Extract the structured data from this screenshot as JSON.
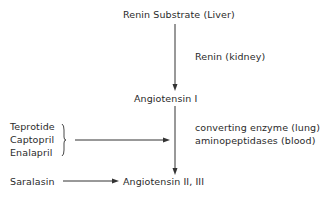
{
  "diagram": {
    "nodes": {
      "substrate": "Renin Substrate (Liver)",
      "angiotensin1": "Angiotensin I",
      "angiotensin23": "Angiotensin II, III"
    },
    "enzymes": {
      "renin": "Renin (kidney)",
      "converting_line1": "converting enzyme (lung)",
      "converting_line2": "aminopeptidases (blood)"
    },
    "inhibitors": {
      "ace_group": [
        "Teprotide",
        "Captopril",
        "Enalapril"
      ],
      "receptor_antagonist": "Saralasin"
    },
    "colors": {
      "text": "#2a2a2a",
      "lines": "#333333",
      "background": "#ffffff"
    }
  }
}
